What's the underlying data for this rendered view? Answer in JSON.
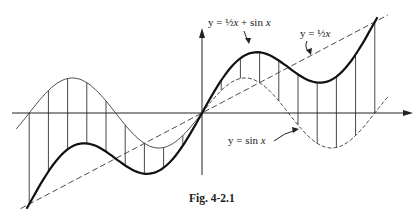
{
  "figure": {
    "caption": "Fig. 4-2.1",
    "labels": {
      "sum_curve": {
        "prefix": "y = ",
        "frac": "½",
        "x": "x",
        "rest": " + sin ",
        "x2": "x"
      },
      "line": {
        "prefix": "y = ",
        "frac": "½",
        "x": "x"
      },
      "sine": {
        "prefix": "y = sin ",
        "x": "x"
      }
    }
  },
  "chart_data": {
    "type": "line",
    "caption": "Fig. 4-2.1",
    "x_range": [
      "-2π",
      "2π"
    ],
    "origin_px": [
      202,
      113
    ],
    "x_unit_px": 27.5,
    "y_unit_px": 29,
    "sine_amplitude_px": 35,
    "ordinate_step": "2π/9",
    "series": [
      {
        "name": "y = ½x + sin x",
        "style": "bold solid",
        "formula": "0.5*x + sin(x)"
      },
      {
        "name": "y = ½x",
        "style": "dashed",
        "formula": "0.5*x"
      },
      {
        "name": "y = sin x",
        "style": "thin solid (x<0), dashed (x>0)",
        "formula": "sin(x)"
      }
    ],
    "ordinates": "vertical segments joining y = sin x to y = ½x + sin x at 19 equally spaced x values from -2π to 2π",
    "axes": {
      "x_arrow": true,
      "y_arrow": true,
      "ticks": false,
      "grid": false
    }
  }
}
